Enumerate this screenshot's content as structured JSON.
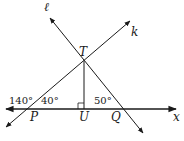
{
  "diagram": {
    "labels": {
      "line_l": "ℓ",
      "line_k": "k",
      "point_T": "T",
      "point_P": "P",
      "point_U": "U",
      "point_Q": "Q",
      "axis_x": "x"
    },
    "angles": {
      "exterior_at_P": "140°",
      "interior_at_P": "40°",
      "interior_at_Q": "50°"
    },
    "right_angle_at": "U",
    "colors": {
      "line": "#1a1a1a",
      "background": "#ffffff"
    }
  }
}
